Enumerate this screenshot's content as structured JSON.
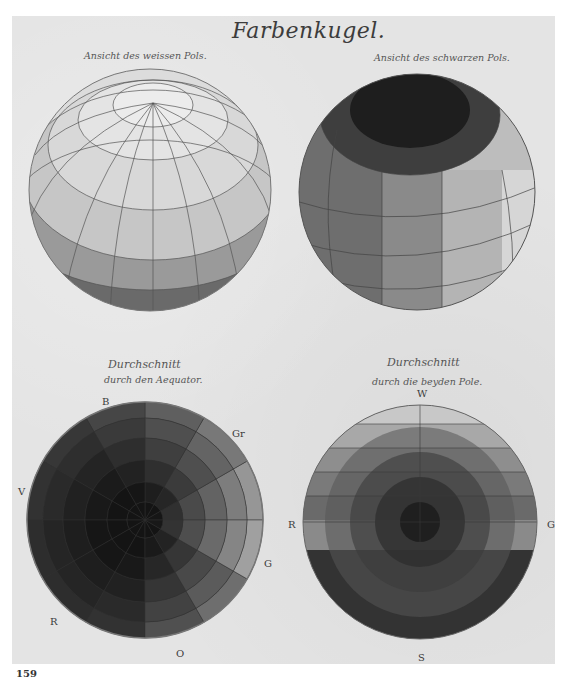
{
  "plate": {
    "title": "Farbenkugel.",
    "page_number": "159"
  },
  "figures": [
    {
      "id": "white-pole-view",
      "caption": "Ansicht des weissen Pols."
    },
    {
      "id": "black-pole-view",
      "caption": "Ansicht des schwarzen Pols."
    },
    {
      "id": "equator-section",
      "caption_line1": "Durchschnitt",
      "caption_line2": "durch den Aequator.",
      "labels": {
        "top": "B",
        "upper_right": "Gr",
        "left": "V",
        "right": "G",
        "lower_left": "R",
        "bottom": "O"
      }
    },
    {
      "id": "poles-section",
      "caption_line1": "Durchschnitt",
      "caption_line2": "durch die beyden Pole.",
      "labels": {
        "top": "W",
        "left": "R",
        "right": "G",
        "bottom": "S"
      }
    }
  ]
}
